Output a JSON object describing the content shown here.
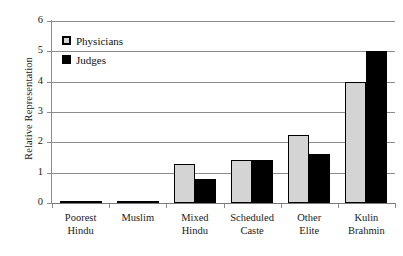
{
  "chart_data": {
    "type": "bar",
    "title": "",
    "xlabel": "",
    "ylabel": "Relative Representation",
    "ylim": [
      0,
      6
    ],
    "y_ticks": [
      "0",
      "1",
      "2",
      "3",
      "4",
      "5",
      "6"
    ],
    "grid": true,
    "legend_position": "upper-left-inside",
    "categories": [
      "Poorest Hindu",
      "Muslim",
      "Mixed Hindu",
      "Scheduled Caste",
      "Other Elite",
      "Kulin Brahmin"
    ],
    "category_lines": [
      [
        "Poorest",
        "Hindu"
      ],
      [
        "Muslim",
        ""
      ],
      [
        "Mixed",
        "Hindu"
      ],
      [
        "Scheduled",
        "Caste"
      ],
      [
        "Other",
        "Elite"
      ],
      [
        "Kulin",
        "Brahmin"
      ]
    ],
    "series": [
      {
        "name": "Physicians",
        "color": "#d4d4d4",
        "edge_color": "#000000",
        "values": [
          0.03,
          0.08,
          1.3,
          1.42,
          2.25,
          4.0
        ]
      },
      {
        "name": "Judges",
        "color": "#000000",
        "edge_color": "#000000",
        "values": [
          0.03,
          0.08,
          0.8,
          1.42,
          1.6,
          5.0
        ]
      }
    ]
  },
  "legend": {
    "entries": [
      {
        "label": "Physicians"
      },
      {
        "label": "Judges"
      }
    ]
  },
  "axes": {
    "y_title": "Relative Representation"
  }
}
